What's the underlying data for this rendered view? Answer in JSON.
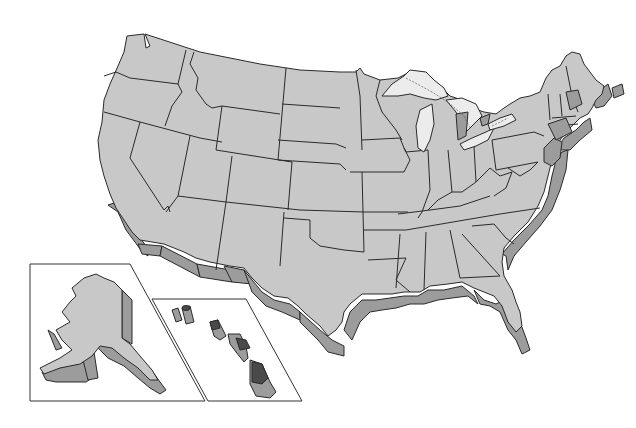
{
  "map": {
    "type": "blank outline map",
    "subject": "United States",
    "style": "3D extruded relief, grayscale",
    "labels": [],
    "colors": {
      "background": "#ffffff",
      "land_top": "#c8c8c8",
      "land_side": "#9c9c9c",
      "lakes": "#ececec",
      "hawaii_dark": "#4a4a4a",
      "outline": "#2a2a2a"
    },
    "regions": {
      "contiguous": "contiguous-48-states",
      "insets": [
        {
          "name": "Alaska",
          "position": "bottom-left"
        },
        {
          "name": "Hawaii",
          "position": "bottom-center"
        }
      ]
    }
  }
}
